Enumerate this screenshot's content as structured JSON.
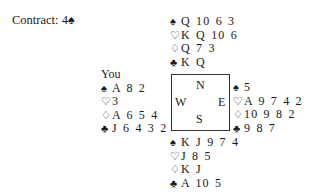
{
  "contract": {
    "label": "Contract: 4♠",
    "level": "4",
    "strain": "♠"
  },
  "suit_symbols": {
    "spades": "♠",
    "hearts": "♡",
    "diamonds": "♢",
    "clubs": "♣"
  },
  "compass": {
    "north": "N",
    "west": "W",
    "east": "E",
    "south": "S"
  },
  "hands": {
    "north": {
      "label": "",
      "spades": "Q 10 6 3",
      "hearts": "K Q 10 6",
      "diamonds": "Q 7 3",
      "clubs": "K Q"
    },
    "west": {
      "label": "You",
      "spades": "A 8 2",
      "hearts": "3",
      "diamonds": "A 6 5 4",
      "clubs": "J 6 4 3 2"
    },
    "east": {
      "label": "",
      "spades": "5",
      "hearts": "A 9 7 4 2",
      "diamonds": "10 9 8 2",
      "clubs": "9 8 7"
    },
    "south": {
      "label": "",
      "spades": "K J 9 7 4",
      "hearts": "J 8 5",
      "diamonds": "K J",
      "clubs": "A 10 5"
    }
  }
}
